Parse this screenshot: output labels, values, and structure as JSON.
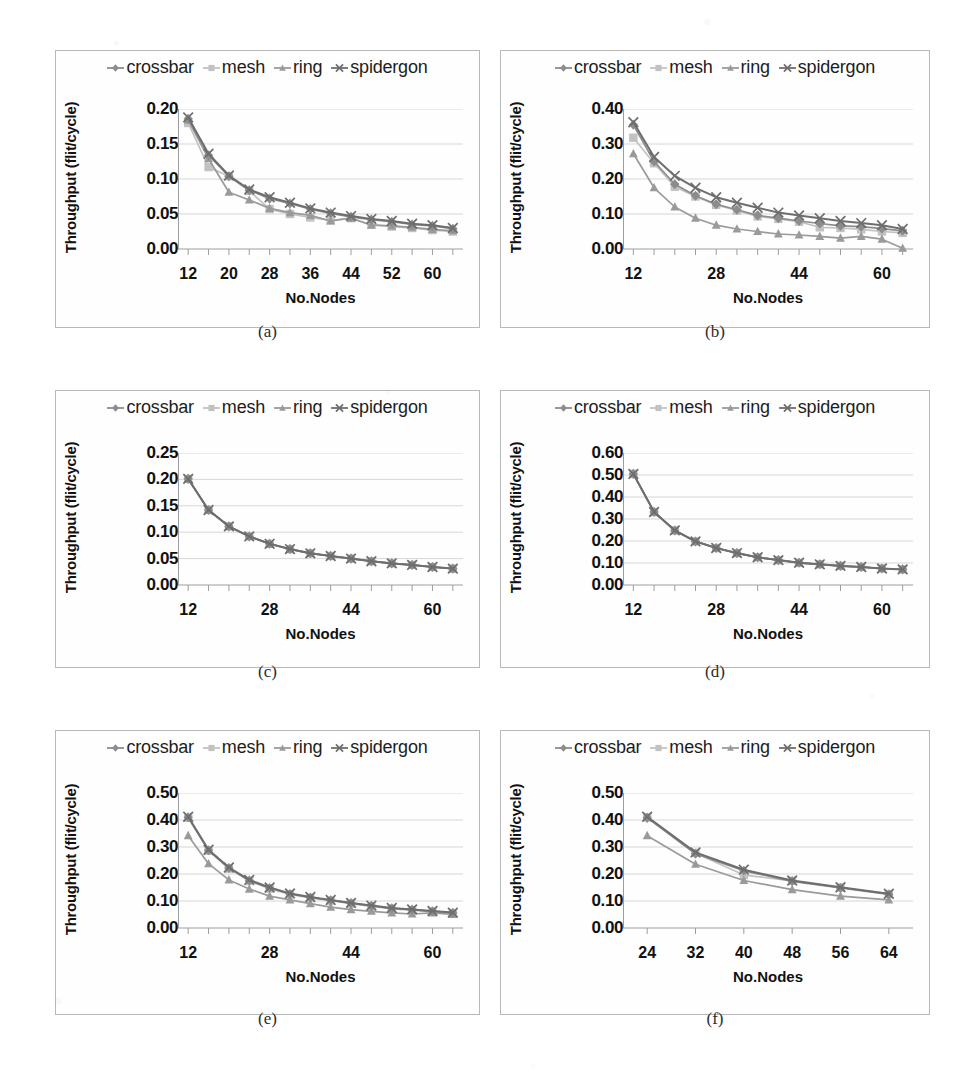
{
  "figure": {
    "panel_label_a": "(a)",
    "panel_label_b": "(b)",
    "panel_label_c": "(c)",
    "panel_label_d": "(d)",
    "panel_label_e": "(e)",
    "panel_label_f": "(f)"
  },
  "axis_titles": {
    "y": "Throughput (flit/cycle)",
    "x": "No.Nodes"
  },
  "legend": {
    "items": [
      {
        "label": "crossbar",
        "marker": "diamond-marker",
        "color": "#8c8c8c"
      },
      {
        "label": "mesh",
        "marker": "square-marker",
        "color": "#c2c2c2"
      },
      {
        "label": "ring",
        "marker": "triangle-marker",
        "color": "#9a9a9a"
      },
      {
        "label": "spidergon",
        "marker": "cross-marker",
        "color": "#6e6e6e"
      }
    ]
  },
  "colors": {
    "crossbar": "#8c8c8c",
    "mesh": "#c2c2c2",
    "ring": "#9a9a9a",
    "spidergon": "#6e6e6e",
    "grid": "#d2d2d2",
    "axis": "#9d9d9d",
    "border": "#b9b9b9",
    "text": "#111111"
  },
  "chart_data": [
    {
      "id": "a",
      "type": "line",
      "title": "(a)",
      "xlabel": "No.Nodes",
      "ylabel": "Throughput (flit/cycle)",
      "xlim": [
        10,
        66
      ],
      "ylim": [
        0.0,
        0.2
      ],
      "yticks": [
        0.0,
        0.05,
        0.1,
        0.15,
        0.2
      ],
      "ytick_labels": [
        "0.00",
        "0.05",
        "0.10",
        "0.15",
        "0.20"
      ],
      "xticks": [
        12,
        20,
        28,
        36,
        44,
        52,
        60
      ],
      "xtick_labels": [
        "12",
        "20",
        "28",
        "36",
        "44",
        "52",
        "60"
      ],
      "grid": true,
      "legend_position": "top",
      "x": [
        12,
        16,
        20,
        24,
        28,
        32,
        36,
        40,
        44,
        48,
        52,
        56,
        60,
        64
      ],
      "series": [
        {
          "name": "crossbar",
          "values": [
            0.186,
            0.134,
            0.104,
            0.084,
            0.072,
            0.065,
            0.057,
            0.051,
            0.046,
            0.042,
            0.039,
            0.035,
            0.033,
            0.029
          ]
        },
        {
          "name": "mesh",
          "values": [
            0.18,
            0.117,
            0.104,
            0.083,
            0.057,
            0.05,
            0.045,
            0.041,
            0.044,
            0.035,
            0.032,
            0.03,
            0.027,
            0.025
          ]
        },
        {
          "name": "ring",
          "values": [
            0.184,
            0.129,
            0.081,
            0.07,
            0.058,
            0.052,
            0.048,
            0.04,
            0.044,
            0.034,
            0.033,
            0.031,
            0.028,
            0.026
          ]
        },
        {
          "name": "spidergon",
          "values": [
            0.188,
            0.136,
            0.105,
            0.085,
            0.074,
            0.066,
            0.058,
            0.052,
            0.047,
            0.043,
            0.04,
            0.036,
            0.034,
            0.03
          ]
        }
      ]
    },
    {
      "id": "b",
      "type": "line",
      "title": "(b)",
      "xlabel": "No.Nodes",
      "ylabel": "Throughput (flit/cycle)",
      "xlim": [
        10,
        66
      ],
      "ylim": [
        0.0,
        0.4
      ],
      "yticks": [
        0.0,
        0.1,
        0.2,
        0.3,
        0.4
      ],
      "ytick_labels": [
        "0.00",
        "0.10",
        "0.20",
        "0.30",
        "0.40"
      ],
      "xticks": [
        12,
        28,
        44,
        60
      ],
      "xtick_labels": [
        "12",
        "28",
        "44",
        "60"
      ],
      "grid": true,
      "legend_position": "top",
      "x": [
        12,
        16,
        20,
        24,
        28,
        32,
        36,
        40,
        44,
        48,
        52,
        56,
        60,
        64
      ],
      "series": [
        {
          "name": "crossbar",
          "values": [
            0.355,
            0.25,
            0.185,
            0.152,
            0.128,
            0.112,
            0.096,
            0.088,
            0.08,
            0.073,
            0.066,
            0.064,
            0.058,
            0.052
          ]
        },
        {
          "name": "mesh",
          "values": [
            0.318,
            0.245,
            0.178,
            0.15,
            0.126,
            0.11,
            0.093,
            0.086,
            0.078,
            0.062,
            0.06,
            0.056,
            0.05,
            0.046
          ]
        },
        {
          "name": "ring",
          "values": [
            0.272,
            0.175,
            0.12,
            0.088,
            0.068,
            0.057,
            0.05,
            0.043,
            0.04,
            0.036,
            0.031,
            0.036,
            0.028,
            0.002
          ]
        },
        {
          "name": "spidergon",
          "values": [
            0.362,
            0.263,
            0.209,
            0.175,
            0.148,
            0.132,
            0.118,
            0.104,
            0.096,
            0.088,
            0.08,
            0.074,
            0.068,
            0.057
          ]
        }
      ]
    },
    {
      "id": "c",
      "type": "line",
      "title": "(c)",
      "xlabel": "No.Nodes",
      "ylabel": "Throughput (flit/cycle)",
      "xlim": [
        10,
        66
      ],
      "ylim": [
        0.0,
        0.25
      ],
      "yticks": [
        0.0,
        0.05,
        0.1,
        0.15,
        0.2,
        0.25
      ],
      "ytick_labels": [
        "0.00",
        "0.05",
        "0.10",
        "0.15",
        "0.20",
        "0.25"
      ],
      "xticks": [
        12,
        28,
        44,
        60
      ],
      "xtick_labels": [
        "12",
        "28",
        "44",
        "60"
      ],
      "grid": true,
      "legend_position": "top",
      "x": [
        12,
        16,
        20,
        24,
        28,
        32,
        36,
        40,
        44,
        48,
        52,
        56,
        60,
        64
      ],
      "series": [
        {
          "name": "crossbar",
          "values": [
            0.201,
            0.142,
            0.111,
            0.092,
            0.078,
            0.068,
            0.06,
            0.055,
            0.05,
            0.045,
            0.041,
            0.038,
            0.034,
            0.031
          ]
        },
        {
          "name": "mesh",
          "values": [
            0.201,
            0.142,
            0.111,
            0.092,
            0.078,
            0.068,
            0.06,
            0.055,
            0.05,
            0.045,
            0.041,
            0.038,
            0.034,
            0.031
          ]
        },
        {
          "name": "ring",
          "values": [
            0.201,
            0.142,
            0.111,
            0.092,
            0.078,
            0.068,
            0.06,
            0.055,
            0.05,
            0.045,
            0.041,
            0.038,
            0.034,
            0.031
          ]
        },
        {
          "name": "spidergon",
          "values": [
            0.201,
            0.142,
            0.111,
            0.092,
            0.078,
            0.068,
            0.06,
            0.055,
            0.05,
            0.045,
            0.041,
            0.038,
            0.034,
            0.031
          ]
        }
      ]
    },
    {
      "id": "d",
      "type": "line",
      "title": "(d)",
      "xlabel": "No.Nodes",
      "ylabel": "Throughput (flit/cycle)",
      "xlim": [
        10,
        66
      ],
      "ylim": [
        0.0,
        0.6
      ],
      "yticks": [
        0.0,
        0.1,
        0.2,
        0.3,
        0.4,
        0.5,
        0.6
      ],
      "ytick_labels": [
        "0.00",
        "0.10",
        "0.20",
        "0.30",
        "0.40",
        "0.50",
        "0.60"
      ],
      "xticks": [
        12,
        28,
        44,
        60
      ],
      "xtick_labels": [
        "12",
        "28",
        "44",
        "60"
      ],
      "grid": true,
      "legend_position": "top",
      "x": [
        12,
        16,
        20,
        24,
        28,
        32,
        36,
        40,
        44,
        48,
        52,
        56,
        60,
        64
      ],
      "series": [
        {
          "name": "crossbar",
          "values": [
            0.505,
            0.332,
            0.248,
            0.198,
            0.168,
            0.145,
            0.126,
            0.113,
            0.101,
            0.094,
            0.087,
            0.082,
            0.075,
            0.071
          ]
        },
        {
          "name": "mesh",
          "values": [
            0.505,
            0.332,
            0.248,
            0.198,
            0.168,
            0.145,
            0.126,
            0.113,
            0.101,
            0.094,
            0.087,
            0.082,
            0.075,
            0.071
          ]
        },
        {
          "name": "ring",
          "values": [
            0.505,
            0.332,
            0.248,
            0.198,
            0.168,
            0.145,
            0.126,
            0.113,
            0.101,
            0.094,
            0.087,
            0.082,
            0.075,
            0.071
          ]
        },
        {
          "name": "spidergon",
          "values": [
            0.505,
            0.332,
            0.248,
            0.198,
            0.168,
            0.145,
            0.126,
            0.113,
            0.101,
            0.094,
            0.087,
            0.082,
            0.075,
            0.071
          ]
        }
      ]
    },
    {
      "id": "e",
      "type": "line",
      "title": "(e)",
      "xlabel": "No.Nodes",
      "ylabel": "Throughput (flit/cycle)",
      "xlim": [
        10,
        66
      ],
      "ylim": [
        0.0,
        0.5
      ],
      "yticks": [
        0.0,
        0.1,
        0.2,
        0.3,
        0.4,
        0.5
      ],
      "ytick_labels": [
        "0.00",
        "0.10",
        "0.20",
        "0.30",
        "0.40",
        "0.50"
      ],
      "xticks": [
        12,
        28,
        44,
        60
      ],
      "xtick_labels": [
        "12",
        "28",
        "44",
        "60"
      ],
      "grid": true,
      "legend_position": "top",
      "x": [
        12,
        16,
        20,
        24,
        28,
        32,
        36,
        40,
        44,
        48,
        52,
        56,
        60,
        64
      ],
      "series": [
        {
          "name": "crossbar",
          "values": [
            0.41,
            0.288,
            0.222,
            0.176,
            0.148,
            0.126,
            0.113,
            0.103,
            0.092,
            0.082,
            0.073,
            0.068,
            0.062,
            0.056
          ]
        },
        {
          "name": "mesh",
          "values": [
            0.408,
            0.286,
            0.22,
            0.174,
            0.146,
            0.124,
            0.111,
            0.101,
            0.09,
            0.08,
            0.071,
            0.066,
            0.06,
            0.054
          ]
        },
        {
          "name": "ring",
          "values": [
            0.342,
            0.238,
            0.178,
            0.144,
            0.118,
            0.104,
            0.09,
            0.077,
            0.068,
            0.062,
            0.056,
            0.052,
            0.056,
            0.05
          ]
        },
        {
          "name": "spidergon",
          "values": [
            0.412,
            0.29,
            0.224,
            0.178,
            0.15,
            0.128,
            0.115,
            0.104,
            0.093,
            0.083,
            0.074,
            0.069,
            0.063,
            0.057
          ]
        }
      ]
    },
    {
      "id": "f",
      "type": "line",
      "title": "(f)",
      "xlabel": "No.Nodes",
      "ylabel": "Throughput (flit/cycle)",
      "xlim": [
        20,
        68
      ],
      "ylim": [
        0.0,
        0.5
      ],
      "yticks": [
        0.0,
        0.1,
        0.2,
        0.3,
        0.4,
        0.5
      ],
      "ytick_labels": [
        "0.00",
        "0.10",
        "0.20",
        "0.30",
        "0.40",
        "0.50"
      ],
      "xticks": [
        24,
        32,
        40,
        48,
        56,
        64
      ],
      "xtick_labels": [
        "24",
        "32",
        "40",
        "48",
        "56",
        "64"
      ],
      "grid": true,
      "legend_position": "top",
      "x": [
        24,
        32,
        40,
        48,
        56,
        64
      ],
      "series": [
        {
          "name": "crossbar",
          "values": [
            0.408,
            0.275,
            0.212,
            0.173,
            0.148,
            0.124
          ]
        },
        {
          "name": "mesh",
          "values": [
            0.41,
            0.278,
            0.196,
            0.175,
            0.15,
            0.126
          ]
        },
        {
          "name": "ring",
          "values": [
            0.342,
            0.236,
            0.176,
            0.142,
            0.118,
            0.104
          ]
        },
        {
          "name": "spidergon",
          "values": [
            0.412,
            0.28,
            0.216,
            0.176,
            0.151,
            0.127
          ]
        }
      ]
    }
  ]
}
